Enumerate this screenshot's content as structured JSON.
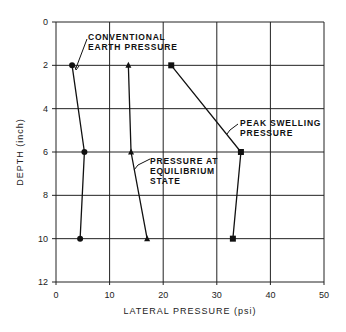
{
  "chart_data": {
    "type": "line",
    "title": "",
    "xlabel": "LATERAL PRESSURE (psi)",
    "ylabel": "DEPTH (inch)",
    "xlim": [
      0,
      50
    ],
    "ylim": [
      12,
      0
    ],
    "y_inverted": true,
    "grid": true,
    "x_ticks": [
      0,
      10,
      20,
      30,
      40,
      50
    ],
    "y_ticks": [
      0,
      2,
      4,
      6,
      8,
      10,
      12
    ],
    "x_tick_labels": [
      "0",
      "10",
      "20",
      "30",
      "40",
      "50"
    ],
    "y_tick_labels": [
      "0",
      "2",
      "4",
      "6",
      "8",
      "10",
      "12"
    ],
    "series": [
      {
        "name": "CONVENTIONAL EARTH PRESSURE",
        "marker": "circle",
        "points": [
          {
            "x": 3.0,
            "y": 2
          },
          {
            "x": 5.3,
            "y": 6
          },
          {
            "x": 4.5,
            "y": 10
          }
        ]
      },
      {
        "name": "PRESSURE AT EQUILIBRIUM STATE",
        "marker": "triangle",
        "points": [
          {
            "x": 13.5,
            "y": 2
          },
          {
            "x": 14.0,
            "y": 6
          },
          {
            "x": 17.0,
            "y": 10
          }
        ]
      },
      {
        "name": "PEAK SWELLING PRESSURE",
        "marker": "square",
        "points": [
          {
            "x": 21.5,
            "y": 2
          },
          {
            "x": 34.5,
            "y": 6
          },
          {
            "x": 33.0,
            "y": 10
          }
        ]
      }
    ],
    "annotations": [
      {
        "lines": [
          "CONVENTIONAL",
          "EARTH PRESSURE"
        ],
        "points_to_series": 0
      },
      {
        "lines": [
          "PRESSURE AT",
          "EQUILIBRIUM",
          "STATE"
        ],
        "points_to_series": 1
      },
      {
        "lines": [
          "PEAK SWELLING",
          "PRESSURE"
        ],
        "points_to_series": 2
      }
    ],
    "legend": "none (inline annotations)"
  },
  "labels": {
    "xlabel": "LATERAL PRESSURE (psi)",
    "ylabel": "DEPTH (inch)",
    "conv_1": "CONVENTIONAL",
    "conv_2": "EARTH PRESSURE",
    "eq_1": "PRESSURE AT",
    "eq_2": "EQUILIBRIUM",
    "eq_3": "STATE",
    "peak_1": "PEAK SWELLING",
    "peak_2": "PRESSURE"
  },
  "colors": {
    "line": "#111111",
    "grid": "#222222",
    "background": "#ffffff"
  }
}
